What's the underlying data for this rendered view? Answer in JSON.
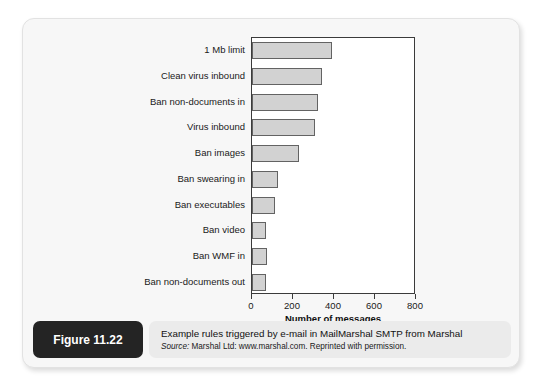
{
  "figure": {
    "badge_label": "Figure 11.22",
    "caption_title": "Example rules triggered by e-mail in MailMarshal SMTP from Marshal",
    "source_prefix": "Source:",
    "source_text": " Marshal Ltd: www.marshal.com. Reprinted with permission."
  },
  "chart_data": {
    "type": "bar",
    "orientation": "horizontal",
    "title": "",
    "xlabel": "Number of messages",
    "ylabel": "",
    "xlim": [
      0,
      800
    ],
    "xticks": [
      0,
      200,
      400,
      600,
      800
    ],
    "xtick_labels": [
      "0",
      "200",
      "400",
      "600",
      "800"
    ],
    "grid": false,
    "legend": false,
    "bar_color": "#d2d2d2",
    "bar_edge_color": "#636363",
    "categories": [
      "1 Mb limit",
      "Clean virus inbound",
      "Ban non-documents in",
      "Virus inbound",
      "Ban images",
      "Ban swearing in",
      "Ban executables",
      "Ban video",
      "Ban WMF in",
      "Ban non-documents out"
    ],
    "values": [
      390,
      340,
      320,
      305,
      230,
      125,
      110,
      70,
      75,
      70
    ]
  }
}
